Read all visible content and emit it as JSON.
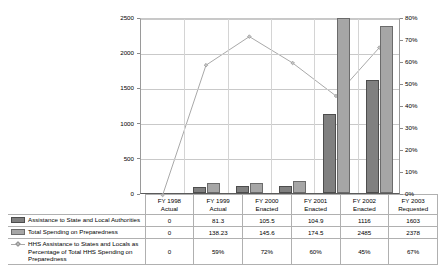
{
  "chart_data": {
    "type": "bar",
    "title": "",
    "xlabel": "",
    "ylabel": "",
    "categories": [
      "FY 1998 Actual",
      "FY 1999 Actual",
      "FY 2000 Enacted",
      "FY 2001 Enacted",
      "FY 2002 Enacted",
      "FY 2003 Requested"
    ],
    "category_lines": [
      [
        "FY 1998",
        "Actual"
      ],
      [
        "FY 1999",
        "Actual"
      ],
      [
        "FY 2000",
        "Enacted"
      ],
      [
        "FY 2001",
        "Enacted"
      ],
      [
        "FY 2002",
        "Enacted"
      ],
      [
        "FY 2003",
        "Requested"
      ]
    ],
    "series": [
      {
        "name": "Assistance to State and Local Authorities",
        "type": "bar",
        "axis": "left",
        "color": "#808080",
        "values": [
          0,
          81.3,
          105.5,
          104.9,
          1116,
          1603
        ],
        "labels": [
          "0",
          "81.3",
          "105.5",
          "104.9",
          "1116",
          "1603"
        ]
      },
      {
        "name": "Total Spending on Preparedness",
        "type": "bar",
        "axis": "left",
        "color": "#a6a6a6",
        "values": [
          0,
          138.23,
          145.6,
          174.5,
          2485,
          2378
        ],
        "labels": [
          "0",
          "138.23",
          "145.6",
          "174.5",
          "2485",
          "2378"
        ]
      },
      {
        "name": "HHS Assistance to States and Locals as Percentage of Total HHS Spending on Preparedness",
        "type": "line",
        "axis": "right",
        "color": "#a9a9a9",
        "values": [
          0,
          59,
          72,
          60,
          45,
          67
        ],
        "labels": [
          "0",
          "59%",
          "72%",
          "60%",
          "45%",
          "67%"
        ]
      }
    ],
    "y_left": {
      "min": 0,
      "max": 2500,
      "step": 500,
      "ticks": [
        "0",
        "500",
        "1000",
        "1500",
        "2000",
        "2500"
      ]
    },
    "y_right": {
      "min": 0,
      "max": 80,
      "step": 10,
      "ticks": [
        "0%",
        "10%",
        "20%",
        "30%",
        "40%",
        "50%",
        "60%",
        "70%",
        "80%"
      ]
    },
    "grid": true,
    "legend_position": "table"
  }
}
